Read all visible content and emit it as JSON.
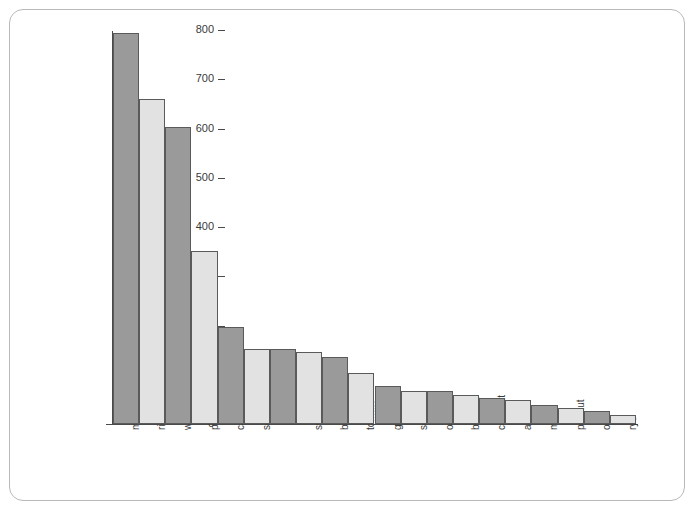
{
  "chart_data": {
    "type": "bar",
    "title": "",
    "subtitle": "",
    "xlabel": "",
    "ylabel": "worldwide production (metric tons × 10⁶)",
    "ylim": [
      0,
      800
    ],
    "ytick_labels": [
      "800",
      "700",
      "600",
      "500",
      "400",
      "300",
      "200",
      "100",
      "0"
    ],
    "ytick_values": [
      800,
      700,
      600,
      500,
      400,
      300,
      200,
      100,
      0
    ],
    "grid": false,
    "legend": "none",
    "categories": [
      "maize",
      "rice",
      "wheat",
      "potato",
      "cassava",
      "soya bean",
      "sugar (cane and beet)",
      "sweet potato",
      "barley",
      "tomato",
      "grape",
      "sorghum",
      "orange",
      "banana",
      "coconut",
      "apple",
      "millet",
      "peanut",
      "oat",
      "rye"
    ],
    "values": [
      793,
      660,
      603,
      352,
      196,
      152,
      153,
      147,
      137,
      104,
      78,
      68,
      68,
      58,
      53,
      48,
      39,
      33,
      27,
      19
    ],
    "bar_shades": [
      "dark",
      "light",
      "dark",
      "light",
      "dark",
      "light",
      "dark",
      "light",
      "dark",
      "light",
      "dark",
      "light",
      "dark",
      "light",
      "dark",
      "light",
      "dark",
      "light",
      "dark",
      "light"
    ]
  },
  "colors": {
    "bar_dark": "#9a9a9a",
    "bar_light": "#e2e2e2",
    "bar_outline": "#5a5a5a",
    "axis": "#4a4a4a",
    "frame": "#b9b9b9",
    "text": "#3a3a3a",
    "background": "#ffffff"
  }
}
